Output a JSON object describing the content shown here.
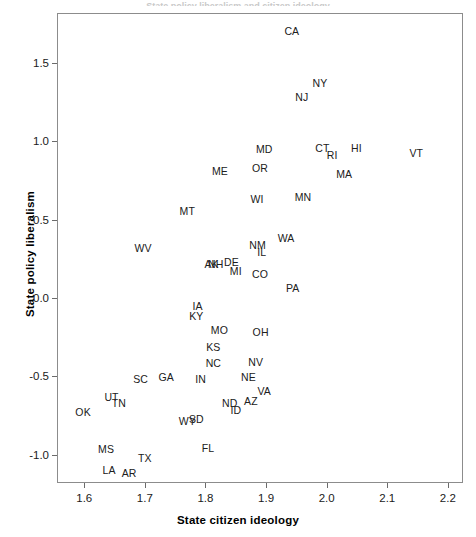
{
  "figure": {
    "top_sliver_text": "State policy liberalism and citizen ideology",
    "background_color": "#ffffff",
    "frame_color": "#8c8c8c",
    "label_color": "#202020"
  },
  "chart_data": {
    "type": "scatter",
    "title": "",
    "xlabel": "State citizen ideology",
    "ylabel": "State policy liberalism",
    "xlim": [
      1.555,
      2.225
    ],
    "ylim": [
      -1.18,
      1.82
    ],
    "xticks": [
      1.6,
      1.7,
      1.8,
      1.9,
      2.0,
      2.1,
      2.2
    ],
    "xticklabels": [
      "1.6",
      "1.7",
      "1.8",
      "1.9",
      "2.0",
      "2.1",
      "2.2"
    ],
    "yticks": [
      1.5,
      1.0,
      0.5,
      0.0,
      -0.5,
      -1.0
    ],
    "yticklabels": [
      "1.5",
      "1.0",
      "0.5",
      "0.0",
      "-0.5",
      "-1.0"
    ],
    "grid": false,
    "legend": false,
    "marker": "text-label",
    "labels": [
      {
        "name": "CA",
        "x": 1.9425,
        "y": 1.705
      },
      {
        "name": "NY",
        "x": 1.989,
        "y": 1.374
      },
      {
        "name": "NJ",
        "x": 1.959,
        "y": 1.282
      },
      {
        "name": "VT",
        "x": 2.148,
        "y": 0.926
      },
      {
        "name": "HI",
        "x": 2.049,
        "y": 0.958
      },
      {
        "name": "CT",
        "x": 1.993,
        "y": 0.958
      },
      {
        "name": "RI",
        "x": 2.009,
        "y": 0.912
      },
      {
        "name": "MD",
        "x": 1.897,
        "y": 0.951
      },
      {
        "name": "MA",
        "x": 2.029,
        "y": 0.795
      },
      {
        "name": "OR",
        "x": 1.89,
        "y": 0.832
      },
      {
        "name": "ME",
        "x": 1.824,
        "y": 0.812
      },
      {
        "name": "MN",
        "x": 1.961,
        "y": 0.645
      },
      {
        "name": "WI",
        "x": 1.885,
        "y": 0.632
      },
      {
        "name": "MT",
        "x": 1.77,
        "y": 0.555
      },
      {
        "name": "WA",
        "x": 1.933,
        "y": 0.381
      },
      {
        "name": "NM",
        "x": 1.886,
        "y": 0.342
      },
      {
        "name": "IL",
        "x": 1.893,
        "y": 0.297
      },
      {
        "name": "WV",
        "x": 1.697,
        "y": 0.323
      },
      {
        "name": "DE",
        "x": 1.843,
        "y": 0.232
      },
      {
        "name": "NH",
        "x": 1.817,
        "y": 0.219
      },
      {
        "name": "AK",
        "x": 1.81,
        "y": 0.219
      },
      {
        "name": "MI",
        "x": 1.85,
        "y": 0.174
      },
      {
        "name": "CO",
        "x": 1.89,
        "y": 0.155
      },
      {
        "name": "PA",
        "x": 1.944,
        "y": 0.065
      },
      {
        "name": "IA",
        "x": 1.787,
        "y": -0.052
      },
      {
        "name": "KY",
        "x": 1.785,
        "y": -0.116
      },
      {
        "name": "MO",
        "x": 1.823,
        "y": -0.206
      },
      {
        "name": "OH",
        "x": 1.891,
        "y": -0.213
      },
      {
        "name": "KS",
        "x": 1.813,
        "y": -0.31
      },
      {
        "name": "NC",
        "x": 1.813,
        "y": -0.413
      },
      {
        "name": "NV",
        "x": 1.883,
        "y": -0.407
      },
      {
        "name": "IN",
        "x": 1.792,
        "y": -0.516
      },
      {
        "name": "NE",
        "x": 1.871,
        "y": -0.503
      },
      {
        "name": "VA",
        "x": 1.897,
        "y": -0.594
      },
      {
        "name": "SC",
        "x": 1.693,
        "y": -0.516
      },
      {
        "name": "GA",
        "x": 1.735,
        "y": -0.503
      },
      {
        "name": "UT",
        "x": 1.645,
        "y": -0.632
      },
      {
        "name": "TN",
        "x": 1.657,
        "y": -0.671
      },
      {
        "name": "ND",
        "x": 1.84,
        "y": -0.671
      },
      {
        "name": "AZ",
        "x": 1.875,
        "y": -0.658
      },
      {
        "name": "ID",
        "x": 1.85,
        "y": -0.716
      },
      {
        "name": "OK",
        "x": 1.598,
        "y": -0.729
      },
      {
        "name": "SD",
        "x": 1.785,
        "y": -0.774
      },
      {
        "name": "WY",
        "x": 1.77,
        "y": -0.787
      },
      {
        "name": "MS",
        "x": 1.636,
        "y": -0.961
      },
      {
        "name": "FL",
        "x": 1.804,
        "y": -0.955
      },
      {
        "name": "TX",
        "x": 1.7,
        "y": -1.019
      },
      {
        "name": "LA",
        "x": 1.641,
        "y": -1.096
      },
      {
        "name": "AR",
        "x": 1.674,
        "y": -1.116
      }
    ]
  }
}
